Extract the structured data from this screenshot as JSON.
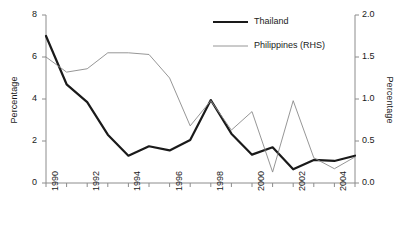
{
  "chart_data": {
    "type": "line",
    "title": "",
    "xlabel": "",
    "ylabel": "Percentage",
    "ylabel_right": "Percentage",
    "x": [
      1990,
      1991,
      1992,
      1993,
      1994,
      1995,
      1996,
      1997,
      1998,
      1999,
      2000,
      2001,
      2002,
      2003,
      2004,
      2005
    ],
    "xlim": [
      1990,
      2005
    ],
    "ylim": [
      0,
      8
    ],
    "ylim_right": [
      0.0,
      2.0
    ],
    "yticks": [
      0,
      2,
      4,
      6,
      8
    ],
    "yticks_right": [
      "0.0",
      "0.5",
      "1.0",
      "1.5",
      "2.0"
    ],
    "xticks_labeled": [
      1990,
      1992,
      1994,
      1996,
      1998,
      2000,
      2002,
      2004
    ],
    "xtick_labels": [
      "1990",
      "1992",
      "1994",
      "1996",
      "1998",
      "2000",
      "2002",
      "2004"
    ],
    "grid": false,
    "legend_position": "top-right",
    "series": [
      {
        "name": "Thailand",
        "axis": "left",
        "color": "#1a1a1a",
        "line_width": 2.2,
        "values": [
          7.0,
          4.7,
          3.85,
          2.3,
          1.3,
          1.75,
          1.55,
          2.05,
          3.95,
          2.35,
          1.35,
          1.7,
          0.65,
          1.1,
          1.05,
          1.3
        ]
      },
      {
        "name": "Philippines (RHS)",
        "axis": "right",
        "color": "#8a8a8a",
        "line_width": 0.9,
        "values": [
          1.5,
          1.32,
          1.36,
          1.55,
          1.55,
          1.53,
          1.25,
          0.68,
          0.98,
          0.63,
          0.85,
          0.13,
          0.98,
          0.3,
          0.17,
          0.31
        ]
      }
    ],
    "legend": [
      {
        "label": "Thailand",
        "color": "#1a1a1a",
        "line_width": 2.2
      },
      {
        "label": "Philippines (RHS)",
        "color": "#8a8a8a",
        "line_width": 0.9
      }
    ]
  },
  "axis_colors": {
    "axis_line": "#8c8c8c",
    "text": "#1a1a1a"
  }
}
